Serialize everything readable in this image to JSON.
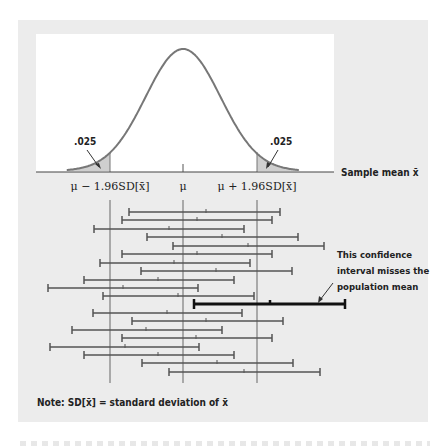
{
  "figure": {
    "tail_area_left": ".025",
    "tail_area_right": ".025",
    "x_axis_label": "Sample mean x̄",
    "tick_labels": {
      "lower": "μ − 1.96SD[x̄]",
      "center": "μ",
      "upper": "μ + 1.96SD[x̄]"
    },
    "annotation": {
      "lines": [
        "This confidence",
        "interval misses the",
        "population mean"
      ]
    },
    "note": "Note: SD[x̄] = standard deviation of x̄",
    "colors": {
      "panel": "#ececec",
      "curve": "#777777",
      "tail_fill": "#cfcfcf",
      "interval": "#555555",
      "highlight_interval": "#111111",
      "text": "#222222"
    }
  },
  "chart_data": {
    "type": "diagram",
    "title": "",
    "distribution": {
      "center": "μ",
      "lower_critical": "μ − 1.96SD[x̄]",
      "upper_critical": "μ + 1.96SD[x̄]",
      "tail_probabilities": [
        0.025,
        0.025
      ]
    },
    "intervals_px": [
      {
        "y": 212,
        "lo": 129,
        "mid": 206,
        "hi": 280,
        "misses": false
      },
      {
        "y": 220,
        "lo": 122,
        "mid": 197,
        "hi": 272,
        "misses": false
      },
      {
        "y": 229,
        "lo": 94,
        "mid": 169,
        "hi": 244,
        "misses": false
      },
      {
        "y": 237,
        "lo": 147,
        "mid": 222,
        "hi": 298,
        "misses": false
      },
      {
        "y": 246,
        "lo": 173,
        "mid": 248,
        "hi": 324,
        "misses": false
      },
      {
        "y": 254,
        "lo": 122,
        "mid": 197,
        "hi": 272,
        "misses": false
      },
      {
        "y": 263,
        "lo": 100,
        "mid": 174,
        "hi": 250,
        "misses": false
      },
      {
        "y": 271,
        "lo": 141,
        "mid": 216,
        "hi": 292,
        "misses": false
      },
      {
        "y": 280,
        "lo": 84,
        "mid": 158,
        "hi": 234,
        "misses": false
      },
      {
        "y": 288,
        "lo": 48,
        "mid": 123,
        "hi": 198,
        "misses": false
      },
      {
        "y": 296,
        "lo": 103,
        "mid": 178,
        "hi": 254,
        "misses": false
      },
      {
        "y": 304,
        "lo": 194,
        "mid": 270,
        "hi": 345,
        "misses": true
      },
      {
        "y": 313,
        "lo": 93,
        "mid": 167,
        "hi": 242,
        "misses": false
      },
      {
        "y": 321,
        "lo": 132,
        "mid": 206,
        "hi": 283,
        "misses": false
      },
      {
        "y": 330,
        "lo": 72,
        "mid": 146,
        "hi": 222,
        "misses": false
      },
      {
        "y": 338,
        "lo": 122,
        "mid": 196,
        "hi": 272,
        "misses": false
      },
      {
        "y": 347,
        "lo": 50,
        "mid": 125,
        "hi": 199,
        "misses": false
      },
      {
        "y": 355,
        "lo": 84,
        "mid": 158,
        "hi": 234,
        "misses": false
      },
      {
        "y": 363,
        "lo": 142,
        "mid": 217,
        "hi": 293,
        "misses": false
      },
      {
        "y": 372,
        "lo": 169,
        "mid": 244,
        "hi": 320,
        "misses": false
      }
    ],
    "reference_lines_px": {
      "lower": 110,
      "mu": 183,
      "upper": 257
    }
  }
}
